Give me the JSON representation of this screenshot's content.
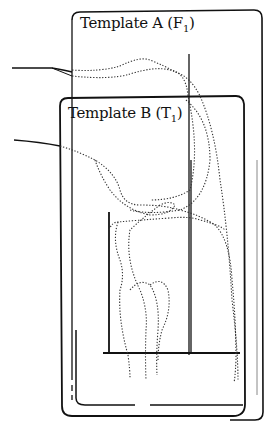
{
  "diagram": {
    "template_a": {
      "label": "Template A (F",
      "subscript": "1",
      "close": ")"
    },
    "template_b": {
      "label": "Template B (T",
      "subscript": "1",
      "close": ")"
    },
    "colors": {
      "stroke": "#111111",
      "dotted": "#333333",
      "background": "#ffffff"
    }
  }
}
